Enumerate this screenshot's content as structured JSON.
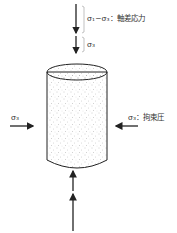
{
  "diagram": {
    "labels": {
      "deviatoric": "σ₁−σ₃：軸差応力",
      "sigma3_top": "σ₃",
      "sigma3_left": "σ₃",
      "sigma3_right": "σ₃：拘束圧"
    },
    "colors": {
      "stroke": "#222222",
      "specimen_fill": "#f2f2f2",
      "stipple": "#9a9a9a"
    }
  }
}
